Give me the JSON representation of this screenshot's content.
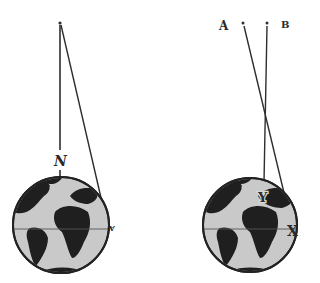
{
  "diagram": {
    "left": {
      "pole_label": "N",
      "edge_label": "A",
      "point": {
        "x": 60,
        "y": 23
      },
      "globe": {
        "cx": 61,
        "cy": 225,
        "r": 48
      }
    },
    "right": {
      "label_a": "A",
      "label_b": "B",
      "label_y": "Y",
      "label_x": "X",
      "point_a": {
        "x": 243,
        "y": 23
      },
      "point_b": {
        "x": 267,
        "y": 23
      },
      "globe": {
        "cx": 250,
        "cy": 225,
        "r": 47
      }
    },
    "colors": {
      "line": "#2e2e2e",
      "land": "#1e1e1e",
      "ocean": "#c8c8c8",
      "outline": "#222222"
    }
  }
}
